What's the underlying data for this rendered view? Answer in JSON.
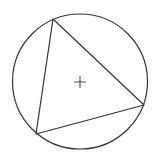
{
  "diagram": {
    "title": "",
    "shapes": [
      "circle",
      "inscribed-triangle",
      "center-marker"
    ],
    "center_marker": "+",
    "colors": {
      "stroke": "#333333",
      "background": "#ffffff"
    }
  }
}
